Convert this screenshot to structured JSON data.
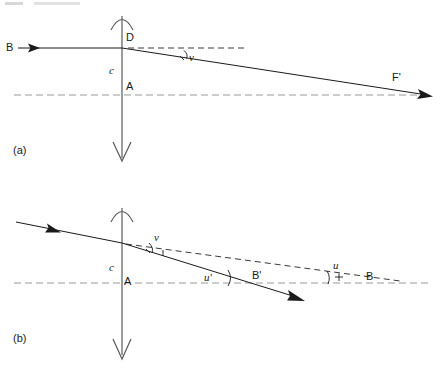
{
  "figure": {
    "caption_a": "(a)",
    "caption_b": "(b)",
    "panel_a": {
      "object_point_label": "B",
      "lens_top_label": "D",
      "lens_center_label": "A",
      "lens_symbol_label": "c",
      "focal_point_label": "F'",
      "angle_v_label": "v"
    },
    "panel_b": {
      "lens_center_label": "A",
      "lens_symbol_label": "c",
      "angle_v_label": "v",
      "angle_u_prime_label": "u'",
      "angle_u_label": "u",
      "image_point_label": "B'",
      "object_point_label": "B"
    }
  },
  "colors": {
    "ink": "#1a1a1a",
    "lens": "#5a5a5a",
    "axis": "#9a9a9a",
    "background": "#ffffff"
  },
  "diagram_data": {
    "type": "optical-ray-diagram",
    "panels": [
      {
        "id": "a",
        "description": "Parallel ray from B strikes diverging lens at D and refracts downward toward focal point F'",
        "optical_axis_y": 95,
        "lens_x": 122,
        "lens_top_y": 12,
        "lens_bottom_y": 162,
        "incident_ray": {
          "x1": 18,
          "y1": 48,
          "x2": 122,
          "y2": 48
        },
        "refracted_ray": {
          "x1": 122,
          "y1": 48,
          "x2": 432,
          "y2": 96
        },
        "dashed_extension": {
          "x1": 127,
          "y1": 48,
          "x2": 246,
          "y2": 48
        },
        "angle_v_vertex": {
          "x": 122,
          "y": 48
        }
      },
      {
        "id": "b",
        "description": "Oblique ray from object point B refracts at lens and converges to image point B' direction",
        "optical_axis_y": 283,
        "lens_x": 122,
        "lens_top_y": 203,
        "lens_bottom_y": 360,
        "incident_ray": {
          "x1": 16,
          "y1": 222,
          "x2": 122,
          "y2": 243
        },
        "refracted_ray": {
          "x1": 122,
          "y1": 243,
          "x2": 303,
          "y2": 300
        },
        "dashed_extension": {
          "x1": 126,
          "y1": 244,
          "x2": 400,
          "y2": 283
        },
        "angle_u_prime_vertex": {
          "x": 224,
          "y": 283
        },
        "angle_u_vertex": {
          "x": 330,
          "y": 283
        }
      }
    ]
  }
}
